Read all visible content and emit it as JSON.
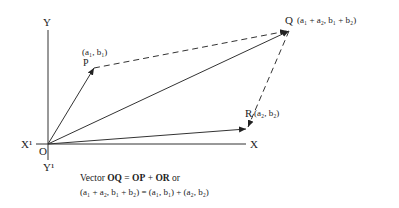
{
  "axes": {
    "y_label": "Y",
    "y_neg_label": "Y¹",
    "x_label": "X",
    "x_neg_label": "X¹",
    "origin_label": "O"
  },
  "points": {
    "P": {
      "name": "P",
      "coords": "(a₁, b₁)"
    },
    "Q": {
      "name": "Q",
      "coords": "(a₁ + a₂, b₁ + b₂)"
    },
    "R": {
      "name": "R",
      "coords": "(a₂, b₂)"
    }
  },
  "caption": {
    "prefix": "Vector ",
    "oq": "OQ",
    "eq": " = ",
    "op": "OP",
    "plus": " + ",
    "or_vec": "OR",
    "suffix": " or",
    "line2": "(a₁ + a₂, b₁ + b₂) = (a₁, b₁) + (a₂, b₂)"
  },
  "colors": {
    "stroke": "#333333",
    "text": "#222222"
  }
}
